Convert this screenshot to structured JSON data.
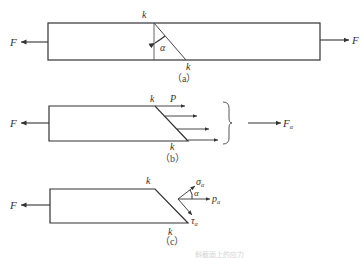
{
  "figure": {
    "panel_a": {
      "caption": "（a）",
      "labels": {
        "force_left": "F",
        "force_right": "F",
        "section_top": "k",
        "section_bottom": "k",
        "angle": "α"
      }
    },
    "panel_b": {
      "caption": "（b）",
      "labels": {
        "force_left": "F",
        "section_top": "k",
        "section_bottom": "k",
        "stress": "P",
        "resultant": "F",
        "resultant_sub": "α"
      }
    },
    "panel_c": {
      "caption": "（c）",
      "labels": {
        "force_left": "F",
        "section_top": "k",
        "section_bottom": "k",
        "normal_stress": "σ",
        "shear_stress": "τ",
        "total_stress": "p",
        "sub": "α",
        "angle": "α"
      }
    },
    "footer_caption": "斜截面上的应力"
  },
  "colors": {
    "line": "#333333",
    "text": "#333333"
  }
}
